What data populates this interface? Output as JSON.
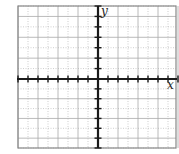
{
  "chart_data": {
    "type": "scatter",
    "title": "",
    "xlabel": "x",
    "ylabel": "y",
    "xlim": [
      -8,
      8
    ],
    "ylim": [
      -7,
      7
    ],
    "grid": true,
    "grid_major_every": 2,
    "grid_minor_every": 1,
    "x_ticks": [
      -8,
      -7,
      -6,
      -5,
      -4,
      -3,
      -2,
      -1,
      1,
      2,
      3,
      4,
      5,
      6,
      7,
      8
    ],
    "y_ticks": [
      -7,
      -6,
      -5,
      -4,
      -3,
      -2,
      -1,
      1,
      2,
      3,
      4,
      5,
      6,
      7
    ],
    "tick_labels_shown": false,
    "series": [],
    "legend": null
  },
  "labels": {
    "x_axis": "x",
    "y_axis": "y"
  },
  "colors": {
    "background": "#ffffff",
    "frame": "#888888",
    "grid_major": "#a8a8a8",
    "grid_minor": "#b8b8b8",
    "axis": "#1a1a1a"
  }
}
